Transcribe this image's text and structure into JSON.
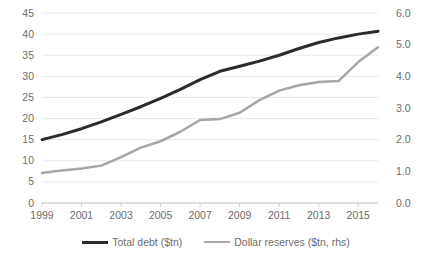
{
  "chart_data": {
    "type": "line",
    "title": "",
    "xlabel": "",
    "ylabel": "",
    "y2label": "",
    "grid": true,
    "legend_position": "bottom",
    "x": [
      1999,
      2000,
      2001,
      2002,
      2003,
      2004,
      2005,
      2006,
      2007,
      2008,
      2009,
      2010,
      2011,
      2012,
      2013,
      2014,
      2015,
      2016
    ],
    "xtick_labels": [
      "1999",
      "2001",
      "2003",
      "2005",
      "2007",
      "2009",
      "2011",
      "2013",
      "2015"
    ],
    "xtick_values": [
      1999,
      2001,
      2003,
      2005,
      2007,
      2009,
      2011,
      2013,
      2015
    ],
    "xlim": [
      1999,
      2016
    ],
    "ylim": [
      0,
      45
    ],
    "ytick_labels": [
      "0",
      "5",
      "10",
      "15",
      "20",
      "25",
      "30",
      "35",
      "40",
      "45"
    ],
    "ytick_values": [
      0,
      5,
      10,
      15,
      20,
      25,
      30,
      35,
      40,
      45
    ],
    "y2lim": [
      0.0,
      6.0
    ],
    "y2tick_labels": [
      "0.0",
      "1.0",
      "2.0",
      "3.0",
      "4.0",
      "5.0",
      "6.0"
    ],
    "y2tick_values": [
      0.0,
      1.0,
      2.0,
      3.0,
      4.0,
      5.0,
      6.0
    ],
    "series": [
      {
        "name": "Total debt ($tn)",
        "axis": "left",
        "color": "#2b2b2b",
        "width": 3,
        "values": [
          15.0,
          16.2,
          17.6,
          19.2,
          21.0,
          22.8,
          24.8,
          26.9,
          29.2,
          31.2,
          32.4,
          33.6,
          35.0,
          36.6,
          38.0,
          39.1,
          40.0,
          40.7
        ]
      },
      {
        "name": "Dollar reserves ($tn, rhs)",
        "axis": "right",
        "color": "#a6a6a6",
        "width": 2.5,
        "values": [
          0.95,
          1.03,
          1.09,
          1.18,
          1.45,
          1.75,
          1.95,
          2.25,
          2.62,
          2.65,
          2.85,
          3.25,
          3.55,
          3.72,
          3.82,
          3.85,
          4.45,
          4.92
        ]
      }
    ]
  }
}
